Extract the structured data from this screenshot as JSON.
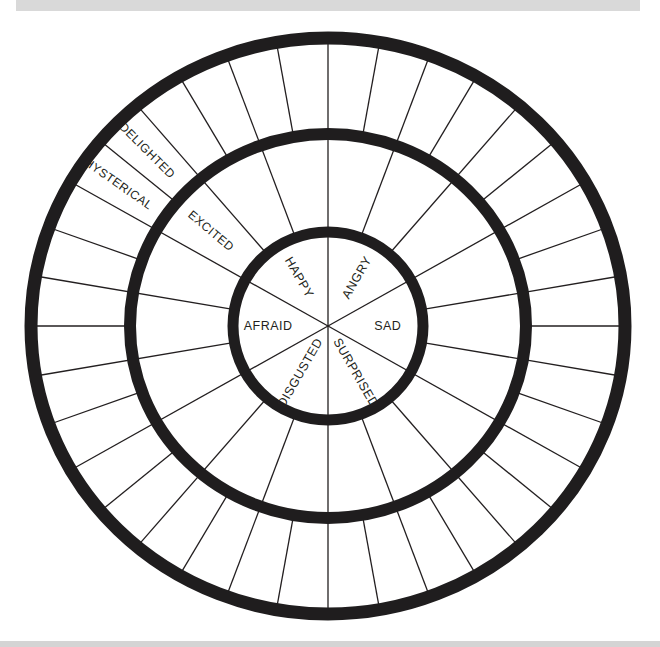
{
  "page": {
    "top_bar": "",
    "bottom_bar": ""
  },
  "wheel": {
    "title": "Emotion Wheel",
    "center": {
      "x": 328,
      "y": 326
    },
    "ring_color": "#1f1d1e",
    "line_color": "#231f20",
    "rings": [
      {
        "name": "inner",
        "rx": 95,
        "ry": 94,
        "stroke": 11
      },
      {
        "name": "middle",
        "rx": 198,
        "ry": 192,
        "stroke": 12
      },
      {
        "name": "outer",
        "rx": 297,
        "ry": 288,
        "stroke": 13
      }
    ],
    "core_sector_count": 6,
    "middle_segment_count": 18,
    "outer_segment_count": 36,
    "core_emotions": [
      {
        "label": "ANGRY",
        "angle": 30,
        "radius": 56
      },
      {
        "label": "SAD",
        "angle": 90,
        "radius": 58
      },
      {
        "label": "SURPRISED",
        "angle": 150,
        "radius": 54
      },
      {
        "label": "DISGUSTED",
        "angle": 210,
        "radius": 54
      },
      {
        "label": "AFRAID",
        "angle": 270,
        "radius": 58
      },
      {
        "label": "HAPPY",
        "angle": 330,
        "radius": 56
      }
    ],
    "middle_emotions": [
      {
        "label": "EXCITED",
        "angle": 310,
        "radius": 148,
        "parent": "HAPPY"
      }
    ],
    "outer_emotions": [
      {
        "label": "HYSTERICAL",
        "angle": 305,
        "radius": 248,
        "parent": "EXCITED"
      },
      {
        "label": "DELIGHTED",
        "angle": 315,
        "radius": 248,
        "parent": "EXCITED"
      }
    ]
  }
}
